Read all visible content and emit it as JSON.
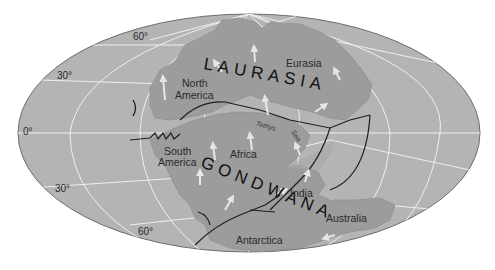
{
  "map": {
    "title": "Pangaea",
    "projection": "elliptical world projection",
    "supercontinents": [
      {
        "name": "LAURASIA",
        "label": "LAURASIA"
      },
      {
        "name": "GONDWANA",
        "label": "GONDWANA"
      }
    ],
    "continents": {
      "north_america": [
        "North",
        "America"
      ],
      "eurasia": "Eurasia",
      "south_america": [
        "South",
        "America"
      ],
      "africa": "Africa",
      "india": "India",
      "australia": "Australia",
      "antarctica": "Antarctica"
    },
    "seas": {
      "tethys": "Tethys",
      "sea": "Sea"
    },
    "latitudes": {
      "n60": "60°",
      "n30": "30°",
      "eq": "0°",
      "s30": "30°",
      "s60": "60°"
    },
    "colors": {
      "ocean": "#b4b4b4",
      "land": "#9c9c9c",
      "graticule": "#efefef",
      "boundary": "#1e1e1e",
      "arrow": "#e6e6e6",
      "outline": "#6e6e6e"
    }
  }
}
